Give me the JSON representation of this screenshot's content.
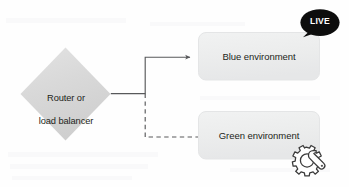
{
  "diagram": {
    "background_color": "#fefefe",
    "nodes": {
      "router": {
        "shape": "diamond",
        "label": "Router or\nload balancer",
        "line1": "Router or",
        "line2": "load balancer",
        "fill_color": "#d9d9d9",
        "text_color": "#231f20"
      },
      "blue_environment": {
        "shape": "rounded-rectangle",
        "label": "Blue environment",
        "fill_color": "#eceded",
        "border_color": "#e2e3e4",
        "text_color": "#231f20"
      },
      "green_environment": {
        "shape": "rounded-rectangle",
        "label": "Green environment",
        "fill_color": "#eceded",
        "border_color": "#e2e3e4",
        "text_color": "#231f20"
      }
    },
    "badges": {
      "live": {
        "label": "LIVE",
        "shape": "speech-bubble",
        "fill_color": "#0d0d0d",
        "text_color": "#ffffff",
        "attached_to": "blue_environment"
      }
    },
    "icons": {
      "gear_wrench": {
        "name": "gear-wrench-icon",
        "stroke_color": "#3b3b3b",
        "fill_color": "#ffffff",
        "attached_to": "green_environment"
      }
    },
    "connectors": [
      {
        "name": "router-to-blue",
        "style": "solid",
        "arrow": "arrowhead-end",
        "color": "#58595b",
        "from": "router",
        "to": "blue_environment"
      },
      {
        "name": "router-to-green",
        "style": "dashed",
        "arrow": "none",
        "color": "#58595b",
        "from": "router",
        "to": "green_environment"
      }
    ]
  }
}
